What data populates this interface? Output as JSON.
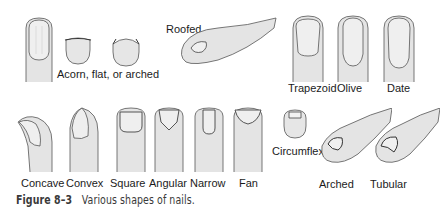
{
  "figure": {
    "caption": {
      "number": "Figure 8–3",
      "text": "Various shapes of nails."
    },
    "labels": {
      "acorn": "Acorn, flat, or arched",
      "roofed": "Roofed",
      "trapezoid": "Trapezoid",
      "olive": "Olive",
      "date": "Date",
      "concave": "Concave",
      "convex": "Convex",
      "square": "Square",
      "angular": "Angular",
      "narrow": "Narrow",
      "fan": "Fan",
      "circumflex": "Circumflex",
      "arched": "Arched",
      "tubular": "Tubular"
    },
    "colors": {
      "skin": "#e6e6e6",
      "outline": "#555555",
      "nail": "#f2f2f2"
    }
  }
}
